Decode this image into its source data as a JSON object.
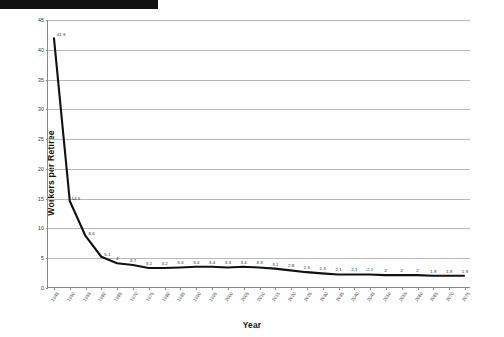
{
  "decor": {
    "top_bar_name": "black-header-bar"
  },
  "chart_data": {
    "type": "line",
    "title": "",
    "xlabel": "Year",
    "ylabel": "Workers per Retiree",
    "ylim": [
      0,
      45
    ],
    "yticks": [
      0,
      5,
      10,
      15,
      20,
      25,
      30,
      35,
      40,
      45
    ],
    "ytick_labels": [
      "0",
      "5",
      "10",
      "15",
      "20",
      "25",
      "30",
      "35",
      "40",
      "45"
    ],
    "grid": true,
    "legend": "none",
    "series_color": "#111111",
    "categories": [
      "1945",
      "1950",
      "1955",
      "1960",
      "1965",
      "1970",
      "1975",
      "1980",
      "1985",
      "1990",
      "1995",
      "2000",
      "2005",
      "2010",
      "2015",
      "2020",
      "2025",
      "2030",
      "2035",
      "2040",
      "2045",
      "2050",
      "2055",
      "2060",
      "2065",
      "2070",
      "2075"
    ],
    "values": [
      41.9,
      14.5,
      8.6,
      5.1,
      4,
      3.7,
      3.2,
      3.2,
      3.3,
      3.4,
      3.4,
      3.3,
      3.4,
      3.3,
      3.1,
      2.8,
      2.5,
      2.3,
      2.1,
      2.1,
      2.1,
      2,
      2,
      2,
      1.9,
      1.9,
      1.9
    ],
    "point_labels": [
      "41.9",
      "14.5",
      "8.6",
      "5.1",
      "4",
      "3.7",
      "3.2",
      "3.2",
      "3.3",
      "3.4",
      "3.4",
      "3.3",
      "3.4",
      "3.3",
      "3.1",
      "2.8",
      "2.5",
      "2.3",
      "2.1",
      "2.1",
      "2.1",
      "2",
      "2",
      "2",
      "1.9",
      "1.9",
      "1.9"
    ]
  },
  "caption": {
    "text": "Social Security Administration, April 2009"
  }
}
